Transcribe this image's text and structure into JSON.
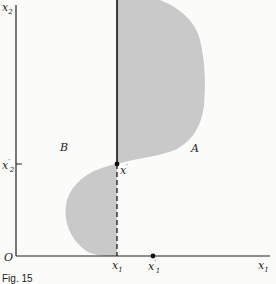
{
  "diagram": {
    "axis_labels": {
      "vertical": "x",
      "vertical_sub": "2",
      "horizontal": "x",
      "horizontal_sub": "1",
      "origin": "O"
    },
    "tick_labels": {
      "x2_prime": {
        "base": "x",
        "prime": "′",
        "sub": "2"
      },
      "x1_bar": {
        "base": "x",
        "sub": "1",
        "mark": "|"
      },
      "x1_prime": {
        "base": "x",
        "prime": "′",
        "sub": "1"
      }
    },
    "point_label": {
      "base": "x",
      "prime": "′"
    },
    "region_labels": {
      "left": "B",
      "right": "A"
    },
    "caption": "Fig. 15",
    "colors": {
      "shape_fill": "#c9c9c9",
      "axis": "#222222",
      "background": "#fbfbf9"
    }
  }
}
